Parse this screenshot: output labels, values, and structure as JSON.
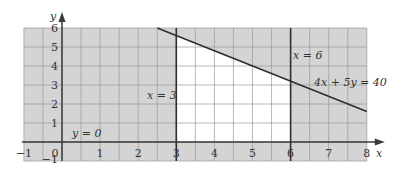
{
  "chart_data": {
    "type": "line",
    "title": "",
    "xlabel": "x",
    "ylabel": "y",
    "xlim": [
      -1,
      8
    ],
    "ylim": [
      -1,
      6
    ],
    "grid": true,
    "x_ticks": [
      "-1",
      "0",
      "1",
      "2",
      "3",
      "4",
      "5",
      "6",
      "7",
      "8"
    ],
    "y_ticks": [
      "-1",
      "1",
      "2",
      "3",
      "4",
      "5",
      "6"
    ],
    "lines": [
      {
        "name": "x = 3",
        "equation": "x = 3",
        "points": [
          [
            3,
            -1
          ],
          [
            3,
            6
          ]
        ]
      },
      {
        "name": "x = 6",
        "equation": "x = 6",
        "points": [
          [
            6,
            -1
          ],
          [
            6,
            6
          ]
        ]
      },
      {
        "name": "4x + 5y = 40",
        "equation": "4x + 5y = 40",
        "points": [
          [
            2.5,
            6
          ],
          [
            8,
            1.6
          ]
        ]
      },
      {
        "name": "y = 0",
        "equation": "y = 0",
        "points": [
          [
            -1,
            0
          ],
          [
            8,
            0
          ]
        ]
      }
    ],
    "feasible_region": {
      "description": "Unshaded region bounded by x = 3, x = 6, y = 0 and 4x + 5y = 40",
      "vertices": [
        [
          3,
          0
        ],
        [
          6,
          0
        ],
        [
          6,
          3.2
        ],
        [
          3,
          5.6
        ]
      ]
    },
    "annotations": [
      {
        "text": "x = 3",
        "at": [
          2.3,
          2.5
        ]
      },
      {
        "text": "x = 6",
        "at": [
          6.3,
          4.6
        ]
      },
      {
        "text": "4x + 5y = 40",
        "at": [
          7.2,
          3.1
        ]
      },
      {
        "text": "y = 0",
        "at": [
          0.8,
          0.4
        ]
      }
    ]
  },
  "colors": {
    "shade": "#d4d4d4",
    "feasible": "#ffffff",
    "grid": "#9a9a9a",
    "axis": "#3a3a3a",
    "line": "#2e2e2e"
  },
  "labels": {
    "x_axis": "x",
    "y_axis": "y",
    "x3": "x = 3",
    "x6": "x = 6",
    "constraint": "4x + 5y = 40",
    "y0": "y = 0"
  }
}
